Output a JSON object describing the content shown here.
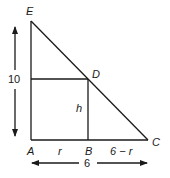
{
  "diagram": {
    "points": {
      "E": {
        "label": "E",
        "x": 31,
        "y": 21
      },
      "A": {
        "label": "A",
        "x": 31,
        "y": 140
      },
      "C": {
        "label": "C",
        "x": 148,
        "y": 140
      },
      "D": {
        "label": "D",
        "x": 88,
        "y": 79
      },
      "B": {
        "label": "B",
        "x": 88,
        "y": 140
      }
    },
    "segment_labels": {
      "AB": "r",
      "BC": "6 − r",
      "DB": "h"
    },
    "dimensions": {
      "vertical": "10",
      "horizontal": "6"
    },
    "colors": {
      "stroke": "#1a1a1a",
      "background": "#ffffff"
    }
  }
}
